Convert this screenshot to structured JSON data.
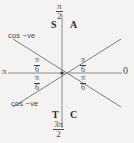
{
  "diagram": {
    "type": "cast-quadrant-diagram",
    "background_color": "#f4f3f1",
    "line_color": "#6b6b6b",
    "text_color": "#3a3a3a",
    "center": {
      "x": 62,
      "y": 73
    },
    "axes": {
      "horizontal": {
        "left_label": "π",
        "right_label": "0"
      },
      "vertical": {
        "top_label": {
          "numerator": "π",
          "denominator": "2"
        },
        "bottom_label": {
          "numerator": "3π",
          "denominator": "2"
        }
      }
    },
    "quadrant_letters": {
      "second": "S",
      "first": "A",
      "third": "T",
      "fourth": "C"
    },
    "angle_labels": [
      {
        "position": "upper-left",
        "numerator": "π",
        "denominator": "6"
      },
      {
        "position": "lower-left",
        "numerator": "π",
        "denominator": "6"
      },
      {
        "position": "upper-right",
        "numerator": "π",
        "denominator": "6"
      },
      {
        "position": "lower-right",
        "numerator": "π",
        "denominator": "6"
      }
    ],
    "annotations": [
      {
        "position": "upper-left",
        "text": "cos −ve"
      },
      {
        "position": "lower-left",
        "text": "cos −ve"
      }
    ]
  }
}
